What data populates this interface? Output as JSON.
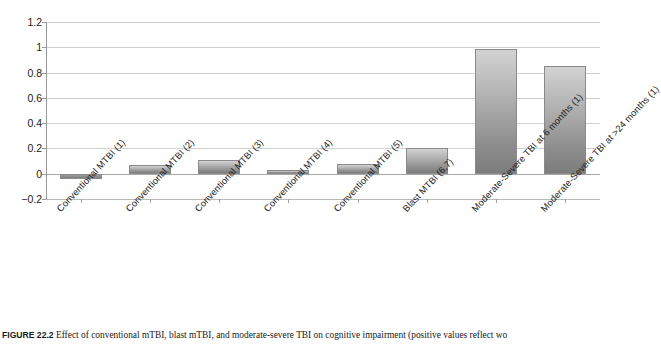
{
  "chart_data": {
    "type": "bar",
    "title": "",
    "xlabel": "",
    "ylabel": "",
    "ylim": [
      -0.2,
      1.2
    ],
    "yticks": [
      "-0.2",
      "0",
      "0.2",
      "0.4",
      "0.6",
      "0.8",
      "1",
      "1.2"
    ],
    "ytick_values": [
      -0.2,
      0,
      0.2,
      0.4,
      0.6,
      0.8,
      1.0,
      1.2
    ],
    "grid": true,
    "legend": "none",
    "categories": [
      "Conventional MTBI (1)",
      "Conventional MTBI (2)",
      "Conventional MTBI (3)",
      "Conventional MTBI (4)",
      "Conventional MTBI (5)",
      "Blast MTBI (6,7)",
      "Moderate-Severe TBI at 6 months (1)",
      "Moderate-Severe TBI at >24 months (1)"
    ],
    "values": [
      -0.045,
      0.07,
      0.11,
      0.03,
      0.08,
      0.2,
      0.99,
      0.85
    ]
  },
  "caption": {
    "figure_number": "FIGURE 22.2",
    "text": "Effect of conventional mTBI, blast mTBI, and moderate-severe TBI on cognitive impairment (positive values reflect wo"
  }
}
